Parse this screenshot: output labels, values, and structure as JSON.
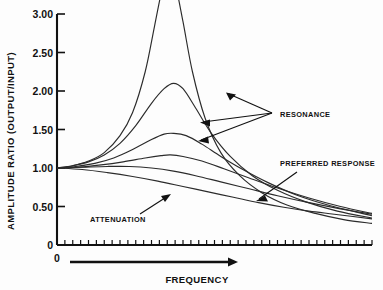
{
  "chart_data": {
    "type": "line",
    "title": "",
    "xlabel": "FREQUENCY",
    "ylabel": "AMPLITUDE RATIO (OUTPUT/INPUT)",
    "xlim": [
      0,
      10
    ],
    "ylim": [
      0,
      3.0
    ],
    "grid": false,
    "legend": "none",
    "x_tick_labels": [
      "0"
    ],
    "y_tick_labels": [
      "0",
      "0.50",
      "1.00",
      "1.50",
      "2.00",
      "2.50",
      "3.00"
    ],
    "y_tick_values": [
      0,
      0.5,
      1.0,
      1.5,
      2.0,
      2.5,
      3.0
    ],
    "x_minor_tick_count": 40,
    "x_axis_arrow": true,
    "series": [
      {
        "name": "damping-1-lowest",
        "peak_value": 3.6,
        "peak_x": 3.55,
        "clipped_at_top": true,
        "x": [
          0.0,
          0.5,
          1.0,
          1.5,
          2.0,
          2.4,
          2.8,
          3.1,
          3.35,
          3.55,
          3.75,
          4.0,
          4.3,
          4.7,
          5.2,
          5.8,
          6.5,
          7.3,
          8.2,
          9.1,
          10.0
        ],
        "y": [
          1.0,
          1.03,
          1.09,
          1.2,
          1.42,
          1.72,
          2.25,
          2.85,
          3.35,
          3.6,
          3.4,
          2.9,
          2.25,
          1.65,
          1.2,
          0.9,
          0.68,
          0.52,
          0.41,
          0.33,
          0.28
        ]
      },
      {
        "name": "damping-2",
        "peak_value": 2.1,
        "peak_x": 3.7,
        "clipped_at_top": false,
        "x": [
          0.0,
          0.5,
          1.0,
          1.5,
          2.0,
          2.5,
          3.0,
          3.4,
          3.7,
          4.0,
          4.4,
          4.9,
          5.5,
          6.2,
          7.0,
          7.9,
          8.9,
          10.0
        ],
        "y": [
          1.0,
          1.03,
          1.08,
          1.17,
          1.32,
          1.55,
          1.84,
          2.03,
          2.1,
          2.03,
          1.78,
          1.45,
          1.15,
          0.9,
          0.71,
          0.56,
          0.44,
          0.35
        ]
      },
      {
        "name": "damping-3",
        "peak_value": 1.45,
        "peak_x": 3.7,
        "clipped_at_top": false,
        "x": [
          0.0,
          0.6,
          1.2,
          1.8,
          2.4,
          3.0,
          3.4,
          3.7,
          4.1,
          4.6,
          5.2,
          5.9,
          6.7,
          7.6,
          8.6,
          10.0
        ],
        "y": [
          1.0,
          1.02,
          1.06,
          1.13,
          1.24,
          1.37,
          1.44,
          1.45,
          1.42,
          1.31,
          1.15,
          0.98,
          0.81,
          0.65,
          0.52,
          0.38
        ]
      },
      {
        "name": "damping-4-preferred",
        "peak_value": 1.17,
        "peak_x": 3.6,
        "clipped_at_top": false,
        "x": [
          0.0,
          0.7,
          1.4,
          2.1,
          2.8,
          3.3,
          3.6,
          4.0,
          4.6,
          5.3,
          6.1,
          7.0,
          8.0,
          9.0,
          10.0
        ],
        "y": [
          1.0,
          1.01,
          1.04,
          1.08,
          1.13,
          1.16,
          1.17,
          1.15,
          1.09,
          0.99,
          0.87,
          0.74,
          0.61,
          0.5,
          0.41
        ]
      },
      {
        "name": "damping-5",
        "peak_value": 1.02,
        "peak_x": 2.3,
        "clipped_at_top": false,
        "x": [
          0.0,
          0.8,
          1.6,
          2.3,
          3.0,
          3.7,
          4.4,
          5.2,
          6.1,
          7.0,
          8.0,
          9.0,
          10.0
        ],
        "y": [
          1.0,
          1.01,
          1.02,
          1.02,
          1.0,
          0.96,
          0.9,
          0.82,
          0.73,
          0.64,
          0.55,
          0.47,
          0.4
        ]
      },
      {
        "name": "damping-6-attenuation",
        "peak_value": 1.0,
        "peak_x": 0.0,
        "clipped_at_top": false,
        "x": [
          0.0,
          0.8,
          1.6,
          2.4,
          3.2,
          4.0,
          4.8,
          5.6,
          6.4,
          7.2,
          8.0,
          8.8,
          10.0
        ],
        "y": [
          1.0,
          0.98,
          0.94,
          0.89,
          0.83,
          0.76,
          0.69,
          0.62,
          0.55,
          0.49,
          0.44,
          0.4,
          0.34
        ]
      }
    ],
    "annotations": [
      {
        "id": "resonance",
        "text": "RESONANCE",
        "arrow_count": 3
      },
      {
        "id": "preferred-response",
        "text": "PREFERRED RESPONSE",
        "arrow_count": 1
      },
      {
        "id": "attenuation",
        "text": "ATTENUATION",
        "arrow_count": 1
      }
    ]
  },
  "axes": {
    "y_title": "AMPLITUDE RATIO (OUTPUT/INPUT)",
    "x_title": "FREQUENCY",
    "y_labels": [
      "3.00",
      "2.50",
      "2.00",
      "1.50",
      "1.00",
      "0.50",
      "0"
    ],
    "x_origin_label": "0"
  },
  "labels": {
    "resonance": "RESONANCE",
    "preferred_response": "PREFERRED RESPONSE",
    "attenuation": "ATTENUATION"
  },
  "colors": {
    "background": "#fdfdfd",
    "ink": "#111111",
    "curve": "#2b2b2b"
  }
}
